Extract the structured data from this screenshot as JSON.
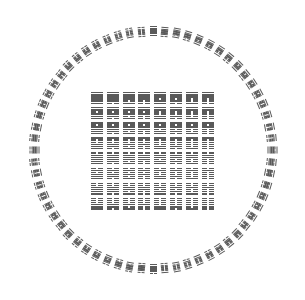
{
  "figure": {
    "ink_color": "#5a5a5a",
    "background": "#ffffff"
  },
  "ring": {
    "center": [
      153,
      150
    ],
    "radius": 119,
    "count": 64
  },
  "square": {
    "rows": 8,
    "cols": 8,
    "origin": [
      91,
      92
    ],
    "pitch_x": 15.8,
    "pitch_y": 15.1
  },
  "hexagrams_binary": [
    "111111",
    "111110",
    "111101",
    "111100",
    "111011",
    "111010",
    "111001",
    "111000",
    "110111",
    "110110",
    "110101",
    "110100",
    "110011",
    "110010",
    "110001",
    "110000",
    "101111",
    "101110",
    "101101",
    "101100",
    "101011",
    "101010",
    "101001",
    "101000",
    "100111",
    "100110",
    "100101",
    "100100",
    "100011",
    "100010",
    "100001",
    "100000",
    "011111",
    "011110",
    "011101",
    "011100",
    "011011",
    "011010",
    "011001",
    "011000",
    "010111",
    "010110",
    "010101",
    "010100",
    "010011",
    "010010",
    "010001",
    "010000",
    "001111",
    "001110",
    "001101",
    "001100",
    "001011",
    "001010",
    "001001",
    "001000",
    "000111",
    "000110",
    "000101",
    "000100",
    "000011",
    "000010",
    "000001",
    "000000"
  ]
}
